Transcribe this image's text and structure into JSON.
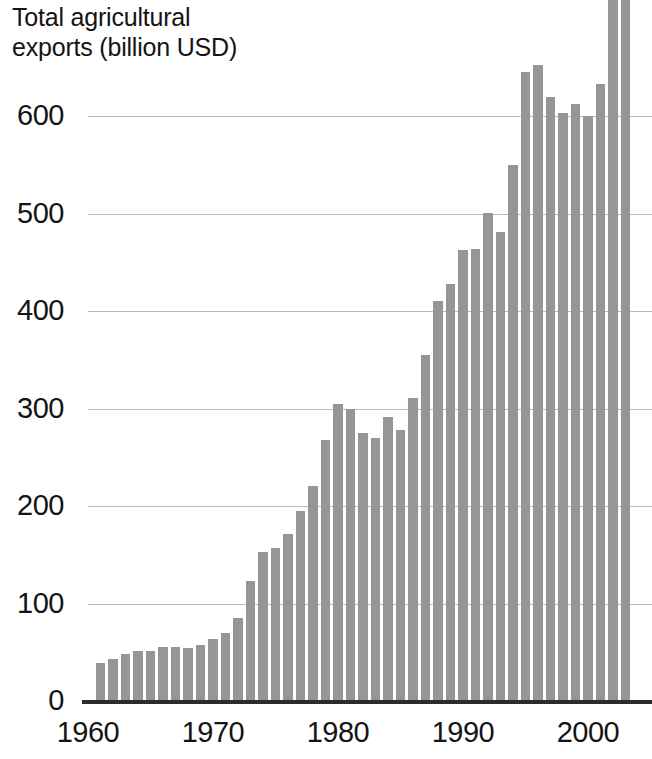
{
  "chart_data": {
    "type": "bar",
    "title": "Total agricultural\nexports (billion USD)",
    "xlabel": "",
    "ylabel": "Total agricultural exports (billion USD)",
    "ylim": [
      0,
      700
    ],
    "xlim": [
      1960.3,
      2003.7
    ],
    "grid": true,
    "legend": null,
    "bar_color": "#969696",
    "axis_color": "#2b2b2b",
    "gridline_color": "#b9b9b9",
    "note": "Final bar (2003) is clipped by the top edge of the figure.",
    "ytick_labels": [
      "600",
      "500",
      "400",
      "300",
      "200",
      "100",
      "0"
    ],
    "yticks": [
      600,
      500,
      400,
      300,
      200,
      100,
      0
    ],
    "xtick_labels": [
      "1960",
      "1970",
      "1980",
      "1990",
      "2000"
    ],
    "xticks": [
      1960,
      1970,
      1980,
      1990,
      2000
    ],
    "categories": [
      1961,
      1962,
      1963,
      1964,
      1965,
      1966,
      1967,
      1968,
      1969,
      1970,
      1971,
      1972,
      1973,
      1974,
      1975,
      1976,
      1977,
      1978,
      1979,
      1980,
      1981,
      1982,
      1983,
      1984,
      1985,
      1986,
      1987,
      1988,
      1989,
      1990,
      1991,
      1992,
      1993,
      1994,
      1995,
      1996,
      1997,
      1998,
      1999,
      2000,
      2001,
      2002,
      2003
    ],
    "values": [
      39,
      43,
      48,
      51,
      51,
      55,
      55,
      54,
      58,
      64,
      70,
      85,
      123,
      153,
      157,
      171,
      195,
      221,
      268,
      305,
      300,
      275,
      270,
      291,
      278,
      311,
      355,
      410,
      428,
      463,
      464,
      501,
      481,
      550,
      645,
      652,
      620,
      603,
      612,
      600,
      633,
      760,
      1100
    ]
  }
}
